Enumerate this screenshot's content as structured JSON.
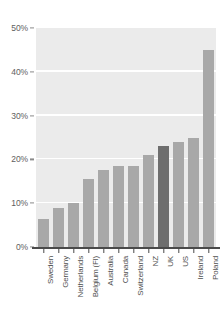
{
  "chart_data": {
    "type": "bar",
    "title": "",
    "subtitle": "",
    "xlabel": "",
    "ylabel": "",
    "categories": [
      "Sweden",
      "Germany",
      "Netherlands",
      "Belgium (Fl)",
      "Australia",
      "Canada",
      "Switzerland",
      "NZ",
      "UK",
      "US",
      "Ireland",
      "Poland"
    ],
    "values": [
      6.5,
      9.0,
      10.0,
      15.5,
      17.5,
      18.5,
      18.5,
      21.0,
      23.0,
      24.0,
      25.0,
      45.0
    ],
    "value_suffix": "%",
    "ylim": [
      0,
      50
    ],
    "ytick_values": [
      0,
      10,
      20,
      30,
      40,
      50
    ],
    "ytick_labels": [
      "0%",
      "10%",
      "20%",
      "30%",
      "40%",
      "50%"
    ],
    "grid": true,
    "grid_axis": "y",
    "legend": null,
    "legend_position": "none",
    "highlight_category": "UK",
    "annotations": [],
    "colors": {
      "bar": "#a8a8a8",
      "bar_highlight": "#6e6e6e",
      "plot_background": "#ebebeb",
      "gridline": "#ffffff",
      "axis": "#4a4a4a",
      "tick_label": "#5e5e5e",
      "category_label": "#4f4f4f",
      "page_background": "#ffffff"
    }
  }
}
